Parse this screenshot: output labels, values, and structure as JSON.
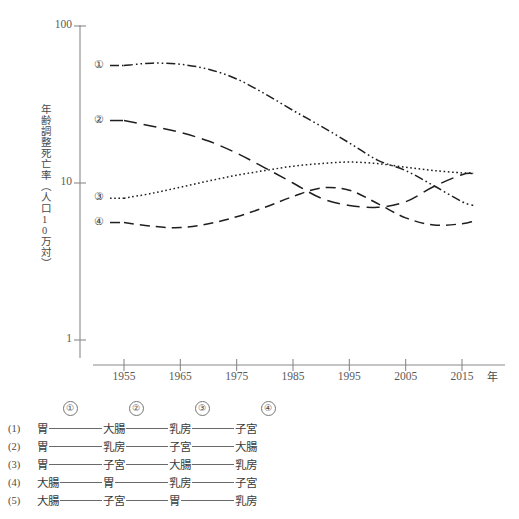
{
  "chart_data": {
    "type": "line",
    "title": "",
    "xlabel": "年",
    "ylabel": "年齢調整死亡率（人口10万対）",
    "xlim": [
      1953,
      2018
    ],
    "ylim": [
      1,
      100
    ],
    "yscale": "log",
    "grid": false,
    "legend": "inline-left-tags",
    "y_ticks": [
      {
        "value": 1,
        "label": "1"
      },
      {
        "value": 10,
        "label": "10"
      },
      {
        "value": 100,
        "label": "100"
      }
    ],
    "x_ticks": [
      {
        "value": 1955,
        "label": "1955"
      },
      {
        "value": 1965,
        "label": "1965"
      },
      {
        "value": 1975,
        "label": "1975"
      },
      {
        "value": 1985,
        "label": "1985"
      },
      {
        "value": 1995,
        "label": "1995"
      },
      {
        "value": 2005,
        "label": "2005"
      },
      {
        "value": 2015,
        "label": "2015"
      }
    ],
    "series": [
      {
        "name": "①",
        "tag": "①",
        "dash": "dash-dot-dot",
        "x": [
          1955,
          1960,
          1965,
          1970,
          1975,
          1980,
          1985,
          1990,
          1995,
          2000,
          2005,
          2010,
          2015,
          2017
        ],
        "values": [
          56,
          58,
          57,
          53,
          46,
          37,
          29,
          23,
          18,
          14,
          12,
          9.6,
          7.6,
          7.2
        ]
      },
      {
        "name": "②",
        "tag": "②",
        "dash": "long-dash",
        "x": [
          1955,
          1960,
          1965,
          1970,
          1975,
          1980,
          1985,
          1990,
          1995,
          2000,
          2005,
          2010,
          2015,
          2017
        ],
        "values": [
          25,
          23,
          21,
          18.5,
          15.5,
          12.5,
          10.0,
          8.0,
          7.2,
          7.0,
          7.6,
          9.5,
          11.3,
          11.5
        ]
      },
      {
        "name": "③",
        "tag": "③",
        "dash": "dotted",
        "x": [
          1955,
          1960,
          1965,
          1970,
          1975,
          1980,
          1985,
          1990,
          1995,
          2000,
          2005,
          2010,
          2015,
          2017
        ],
        "values": [
          8.0,
          8.6,
          9.4,
          10.3,
          11.2,
          12.0,
          12.8,
          13.3,
          13.6,
          13.3,
          12.6,
          12.0,
          11.6,
          11.6
        ]
      },
      {
        "name": "④",
        "tag": "④",
        "dash": "dash",
        "x": [
          1955,
          1960,
          1965,
          1970,
          1975,
          1980,
          1985,
          1990,
          1995,
          2000,
          2005,
          2010,
          2015,
          2017
        ],
        "values": [
          5.6,
          5.3,
          5.2,
          5.5,
          6.1,
          7.0,
          8.2,
          9.3,
          9.0,
          7.4,
          6.0,
          5.4,
          5.5,
          5.7
        ]
      }
    ]
  },
  "axis": {
    "y_title": "年齢調整死亡率（人口10万対）",
    "x_unit": "年"
  },
  "series_tags": [
    "①",
    "②",
    "③",
    "④"
  ],
  "options": {
    "header": [
      "",
      "①",
      "②",
      "③",
      "④"
    ],
    "rows": [
      {
        "num": "(1)",
        "terms": [
          "胃",
          "大腸",
          "乳房",
          "子宮"
        ]
      },
      {
        "num": "(2)",
        "terms": [
          "胃",
          "乳房",
          "子宮",
          "大腸"
        ]
      },
      {
        "num": "(3)",
        "terms": [
          "胃",
          "子宮",
          "大腸",
          "乳房"
        ]
      },
      {
        "num": "(4)",
        "terms": [
          "大腸",
          "胃",
          "乳房",
          "子宮"
        ]
      },
      {
        "num": "(5)",
        "terms": [
          "大腸",
          "子宮",
          "胃",
          "乳房"
        ]
      }
    ]
  },
  "colors": {
    "axis": "#8a8a8a",
    "line": "#1f1f1f",
    "text": "#3b3b3b",
    "rule": "#6a6a6a"
  }
}
